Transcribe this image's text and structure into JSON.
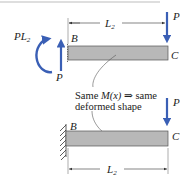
{
  "figure": {
    "top_diagram": {
      "moment_label": "PL",
      "moment_label_sub": "2",
      "reaction_force_label": "P",
      "end_force_label": "P",
      "point_b": "B",
      "point_c": "C",
      "length_label": "L",
      "length_label_sub": "2"
    },
    "annotation": {
      "line1_prefix": "Same ",
      "line1_math": "M(x)",
      "line1_arrow": " ⇒ ",
      "line1_suffix": "same",
      "line2": "deformed shape"
    },
    "bottom_diagram": {
      "end_force_label": "P",
      "point_b": "B",
      "point_c": "C",
      "length_label": "L",
      "length_label_sub": "2",
      "support": "fixed-wall"
    },
    "colors": {
      "force_arrow": "#3a5fb5",
      "beam_fill": "#b8b8b8",
      "beam_stroke": "#555555",
      "top_rule": "#bdbdbd"
    }
  }
}
